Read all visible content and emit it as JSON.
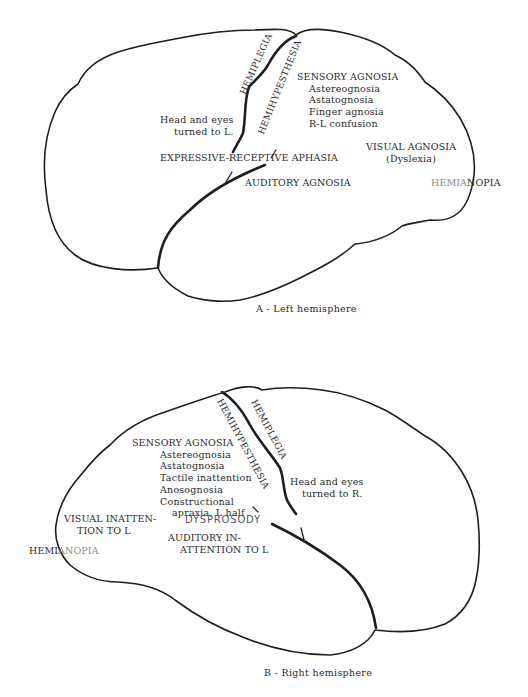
{
  "figure": {
    "panel_a": {
      "caption": "A - Left hemisphere",
      "labels": {
        "hemiplegia": "HEMIPLEGIA",
        "hemihypesthesia": "HEMIHYPESTHESIA",
        "head_eyes": [
          "Head and eyes",
          "turned to L."
        ],
        "sensory_agnosia": {
          "title": "SENSORY AGNOSIA",
          "items": [
            "Astereognosia",
            "Astatognosia",
            "Finger agnosia",
            "R-L confusion"
          ]
        },
        "aphasia": "EXPRESSIVE-RECEPTIVE APHASIA",
        "visual_agnosia": [
          "VISUAL AGNOSIA",
          "(Dyslexia)"
        ],
        "auditory_agnosia": "AUDITORY AGNOSIA",
        "hemianopia_faint": "HEMIA",
        "hemianopia_dark": "NOPIA"
      }
    },
    "panel_b": {
      "caption": "B - Right hemisphere",
      "labels": {
        "hemiplegia": "HEMIPLEGIA",
        "hemihypesthesia": "HEMIHYPESTHESIA",
        "head_eyes": [
          "Head and eyes",
          "turned to R."
        ],
        "sensory_agnosia": {
          "title": "SENSORY AGNOSIA",
          "items": [
            "Astereognosia",
            "Astatognosia",
            "Tactile inattention",
            "Anosognosia",
            "Constructional",
            "apraxia,  L half"
          ]
        },
        "visual_inattention": [
          "VISUAL INATTEN-",
          "TION TO L"
        ],
        "dysprosody": "DYSPROSODY",
        "auditory_inattention": [
          "AUDITORY IN-",
          "ATTENTION TO L"
        ],
        "hemianopia_dark": "HEMI",
        "hemianopia_faint": "ANOPIA"
      }
    }
  }
}
